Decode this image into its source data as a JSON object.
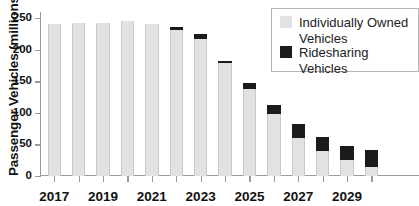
{
  "chart_data": {
    "type": "bar",
    "title": "",
    "subtitle": "",
    "stacked": true,
    "xlabel": "",
    "ylabel": "Passenger Vehicles (millions)",
    "ylim": [
      0,
      260
    ],
    "yticks": [
      0,
      50,
      100,
      150,
      200,
      250
    ],
    "ytick_labels": [
      "0",
      "50",
      "100",
      "150",
      "200",
      "250"
    ],
    "grid": false,
    "legend_position": "top-right",
    "categories": [
      2017,
      2018,
      2019,
      2020,
      2021,
      2022,
      2023,
      2024,
      2025,
      2026,
      2027,
      2028,
      2029,
      2030
    ],
    "xtick_labels_shown": [
      "2017",
      "2019",
      "2021",
      "2023",
      "2025",
      "2027",
      "2029"
    ],
    "series": [
      {
        "name": "Individually Owned Vehicles",
        "color": "#e2e2e2",
        "values": [
          241,
          242,
          243,
          245,
          241,
          232,
          217,
          179,
          138,
          99,
          60,
          39,
          25,
          15
        ]
      },
      {
        "name": "Ridesharing Vehicles",
        "color": "#1b1b1b",
        "values": [
          0,
          0,
          0,
          0,
          0,
          4,
          8,
          4,
          10,
          14,
          22,
          23,
          23,
          27
        ]
      }
    ],
    "totals": [
      241,
      242,
      243,
      245,
      241,
      236,
      225,
      183,
      148,
      113,
      82,
      62,
      48,
      42
    ]
  },
  "legend": {
    "entries": [
      {
        "label": "Individually Owned Vehicles",
        "swatch": "owned"
      },
      {
        "label": "Ridesharing Vehicles",
        "swatch": "ride"
      }
    ]
  },
  "axes": {
    "y_title": "Passenger Vehicles (millions)"
  }
}
